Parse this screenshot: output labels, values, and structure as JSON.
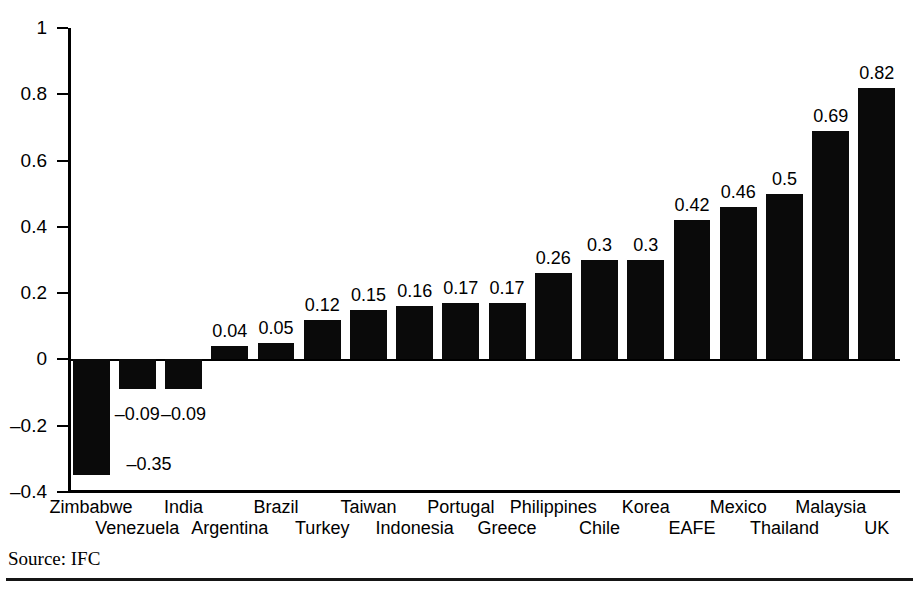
{
  "figure": {
    "title_partial": "",
    "source_note": "Source: IFC"
  },
  "chart_data": {
    "type": "bar",
    "title": "",
    "subtitle": "",
    "xlabel": "",
    "ylabel": "",
    "ylim": [
      -0.4,
      1
    ],
    "yticks": [
      1,
      0.8,
      0.6,
      0.4,
      0.2,
      0,
      -0.2,
      -0.4
    ],
    "ytick_labels": [
      "1",
      "0.8",
      "0.6",
      "0.4",
      "0.2",
      "0",
      "–0.2",
      "–0.4"
    ],
    "grid": false,
    "legend": "none",
    "bar_color": "#0a0a0a",
    "categories": [
      "Zimbabwe",
      "Venezuela",
      "India",
      "Argentina",
      "Brazil",
      "Turkey",
      "Taiwan",
      "Indonesia",
      "Portugal",
      "Greece",
      "Philippines",
      "Chile",
      "Korea",
      "EAFE",
      "Mexico",
      "Thailand",
      "Malaysia",
      "UK"
    ],
    "values": [
      -0.35,
      -0.09,
      -0.09,
      0.04,
      0.05,
      0.12,
      0.15,
      0.16,
      0.17,
      0.17,
      0.26,
      0.3,
      0.3,
      0.42,
      0.46,
      0.5,
      0.69,
      0.82
    ],
    "value_labels": [
      "–0.35",
      "–0.09",
      "–0.09",
      "0.04",
      "0.05",
      "0.12",
      "0.15",
      "0.16",
      "0.17",
      "0.17",
      "0.26",
      "0.3",
      "0.3",
      "0.42",
      "0.46",
      "0.5",
      "0.69",
      "0.82"
    ]
  }
}
